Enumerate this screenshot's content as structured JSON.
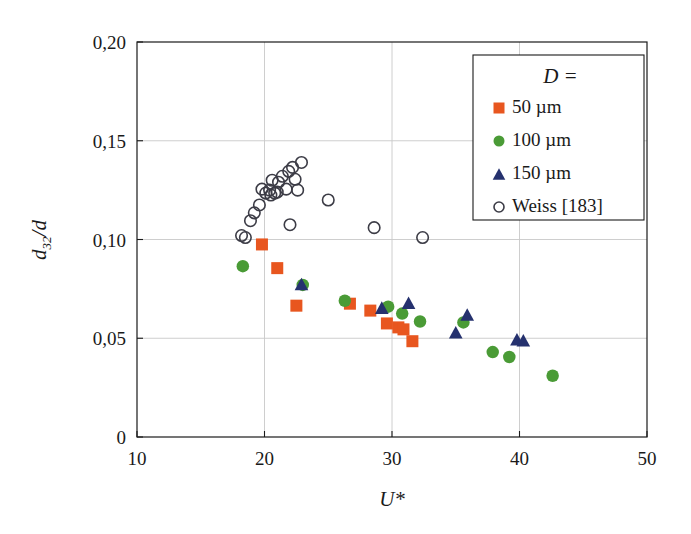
{
  "chart_data": {
    "type": "scatter",
    "title": "",
    "xlabel": "U*",
    "ylabel": "d_32/d",
    "ylabel_display": "d32/d",
    "xlim": [
      10,
      50
    ],
    "ylim": [
      0,
      0.2
    ],
    "grid": true,
    "decimal_separator": ",",
    "xticks": [
      10,
      20,
      30,
      40,
      50
    ],
    "xticklabels": [
      "10",
      "20",
      "30",
      "40",
      "50"
    ],
    "yticks": [
      0,
      0.05,
      0.1,
      0.15,
      0.2
    ],
    "yticklabels": [
      "0",
      "0,05",
      "0,10",
      "0,15",
      "0,20"
    ],
    "legend": {
      "title": "D =",
      "position": "top-right",
      "entries": [
        {
          "label": "50 µm",
          "marker": "square",
          "color": "#e8561f"
        },
        {
          "label": "100 µm",
          "marker": "circle",
          "color": "#4a9b36"
        },
        {
          "label": "150 µm",
          "marker": "triangle",
          "color": "#25316e"
        },
        {
          "label": "Weiss [183]",
          "marker": "open-circle",
          "color": "#3c3c46"
        }
      ]
    },
    "series": [
      {
        "name": "50 µm",
        "marker": "square",
        "color": "#e8561f",
        "points": [
          [
            19.8,
            0.0975
          ],
          [
            21.0,
            0.0855
          ],
          [
            22.5,
            0.0665
          ],
          [
            26.7,
            0.0675
          ],
          [
            28.3,
            0.064
          ],
          [
            29.6,
            0.0575
          ],
          [
            30.5,
            0.0555
          ],
          [
            30.9,
            0.0545
          ],
          [
            31.6,
            0.0485
          ]
        ]
      },
      {
        "name": "100 µm",
        "marker": "circle",
        "color": "#4a9b36",
        "points": [
          [
            18.3,
            0.0865
          ],
          [
            23.0,
            0.077
          ],
          [
            26.3,
            0.069
          ],
          [
            29.7,
            0.066
          ],
          [
            30.8,
            0.0625
          ],
          [
            32.2,
            0.0585
          ],
          [
            35.6,
            0.058
          ],
          [
            37.9,
            0.043
          ],
          [
            39.2,
            0.0405
          ],
          [
            42.6,
            0.031
          ]
        ]
      },
      {
        "name": "150 µm",
        "marker": "triangle",
        "color": "#25316e",
        "points": [
          [
            22.9,
            0.0775
          ],
          [
            29.2,
            0.0655
          ],
          [
            31.3,
            0.068
          ],
          [
            35.0,
            0.053
          ],
          [
            35.9,
            0.062
          ],
          [
            39.8,
            0.0495
          ],
          [
            40.3,
            0.049
          ]
        ]
      },
      {
        "name": "Weiss [183]",
        "marker": "open-circle",
        "color": "#3c3c46",
        "points": [
          [
            18.2,
            0.102
          ],
          [
            18.5,
            0.101
          ],
          [
            18.9,
            0.1095
          ],
          [
            19.2,
            0.1135
          ],
          [
            19.6,
            0.1175
          ],
          [
            19.8,
            0.1255
          ],
          [
            20.1,
            0.1235
          ],
          [
            20.4,
            0.125
          ],
          [
            20.5,
            0.1225
          ],
          [
            20.8,
            0.1235
          ],
          [
            21.0,
            0.124
          ],
          [
            20.6,
            0.13
          ],
          [
            21.1,
            0.129
          ],
          [
            21.4,
            0.132
          ],
          [
            21.7,
            0.1255
          ],
          [
            21.9,
            0.1345
          ],
          [
            22.2,
            0.1365
          ],
          [
            22.4,
            0.1305
          ],
          [
            22.6,
            0.125
          ],
          [
            22.9,
            0.139
          ],
          [
            22.0,
            0.1075
          ],
          [
            25.0,
            0.12
          ],
          [
            28.6,
            0.106
          ],
          [
            32.4,
            0.101
          ]
        ]
      }
    ]
  }
}
